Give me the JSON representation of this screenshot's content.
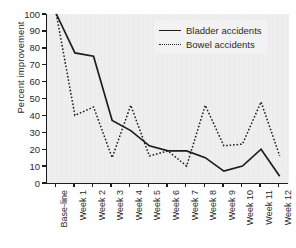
{
  "chart_data": {
    "type": "line",
    "title": "",
    "xlabel": "",
    "ylabel": "Percent improvement",
    "ylim": [
      0,
      100
    ],
    "yticks": [
      0,
      10,
      20,
      30,
      40,
      50,
      60,
      70,
      80,
      90,
      100
    ],
    "grid": false,
    "legend_position": "top-right",
    "categories": [
      "Base-line",
      "Week 1",
      "Week 2",
      "Week 3",
      "Week 4",
      "Week 5",
      "Week 6",
      "Week 7",
      "Week 8",
      "Week 9",
      "Week 10",
      "Week 11",
      "Week 12"
    ],
    "series": [
      {
        "name": "Bladder accidents",
        "style": "solid",
        "color": "#1d1d1d",
        "values": [
          100,
          77,
          75,
          37,
          31,
          22,
          19,
          19,
          15,
          7,
          10,
          20,
          4
        ]
      },
      {
        "name": "Bowel accidents",
        "style": "dotted",
        "color": "#1d1d1d",
        "values": [
          100,
          40,
          45,
          15,
          46,
          16,
          19,
          10,
          46,
          22,
          23,
          48,
          16
        ]
      }
    ]
  },
  "axis": {
    "y_title": "Percent improvement",
    "y_tick_labels": [
      "100",
      "90",
      "80",
      "70",
      "60",
      "50",
      "40",
      "30",
      "20",
      "10",
      "0"
    ],
    "x_tick_labels": [
      "Base-line",
      "Week 1",
      "Week 2",
      "Week 3",
      "Week 4",
      "Week 5",
      "Week 6",
      "Week 7",
      "Week 8",
      "Week 9",
      "Week 10",
      "Week 11",
      "Week 12"
    ]
  },
  "legend": {
    "items": [
      {
        "label": "Bladder accidents",
        "marker": "solid-line-icon"
      },
      {
        "label": "Bowel accidents",
        "marker": "dotted-line-icon"
      }
    ]
  }
}
